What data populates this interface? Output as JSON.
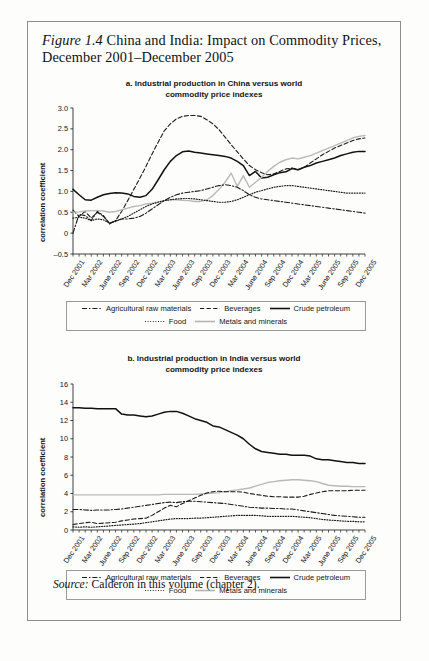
{
  "figure": {
    "label": "Figure 1.4",
    "title": "China and India: Impact on Commodity Prices, December 2001–December 2005",
    "source_label": "Source:",
    "source_text": "Calderón in this volume (chapter 2)."
  },
  "legend": {
    "items": [
      {
        "label": "Agricultural raw materials",
        "style": "dash-dot",
        "color": "#1a1a1a"
      },
      {
        "label": "Beverages",
        "style": "dashed",
        "color": "#1a1a1a"
      },
      {
        "label": "Crude petroleum",
        "style": "solid",
        "color": "#111111"
      },
      {
        "label": "Food",
        "style": "dotted",
        "color": "#1a1a1a"
      },
      {
        "label": "Metals and minerals",
        "style": "solid",
        "color": "#b4b4b4"
      }
    ],
    "row1": [
      "Agricultural raw materials",
      "Beverages",
      "Crude petroleum"
    ],
    "row2": [
      "Food",
      "Metals and minerals"
    ]
  },
  "chart_data": [
    {
      "type": "line",
      "panel": "a",
      "title": "a. Industrial production in China versus world commodity price indexes",
      "title_line1": "a. Industrial production in China versus world",
      "title_line2": "commodity price indexes",
      "xlabel": "",
      "ylabel": "correlation coefficient",
      "ylim": [
        -0.5,
        3.0
      ],
      "yticks": [
        3.0,
        2.5,
        2.0,
        1.5,
        1.0,
        0.5,
        0,
        -0.5
      ],
      "ytick_labels": [
        "3.0",
        "2.5",
        "2.0",
        "1.5",
        "1.0",
        "0.5",
        "0",
        "–0.5"
      ],
      "grid": false,
      "legend_position": "below",
      "x": [
        "Dec 2001",
        "Jan 2002",
        "Feb 2002",
        "Mar 2002",
        "Apr 2002",
        "May 2002",
        "June 2002",
        "July 2002",
        "Aug 2002",
        "Sep 2002",
        "Oct 2002",
        "Nov 2002",
        "Dec 2002",
        "Jan 2003",
        "Feb 2003",
        "Mar 2003",
        "Apr 2003",
        "May 2003",
        "June 2003",
        "July 2003",
        "Aug 2003",
        "Sep 2003",
        "Oct 2003",
        "Nov 2003",
        "Dec 2003",
        "Jan 2004",
        "Feb 2004",
        "Mar 2004",
        "Apr 2004",
        "May 2004",
        "June 2004",
        "July 2004",
        "Aug 2004",
        "Sep 2004",
        "Oct 2004",
        "Nov 2004",
        "Dec 2004",
        "Jan 2005",
        "Feb 2005",
        "Mar 2005",
        "Apr 2005",
        "May 2005",
        "June 2005",
        "July 2005",
        "Aug 2005",
        "Sep 2005",
        "Oct 2005",
        "Nov 2005",
        "Dec 2005"
      ],
      "xtick_labels": [
        "Dec 2001",
        "Mar 2002",
        "June 2002",
        "Sep 2002",
        "Dec 2002",
        "Mar 2003",
        "June 2003",
        "Sep 2003",
        "Dec 2003",
        "Mar 2004",
        "June 2004",
        "Sep 2004",
        "Dec 2004",
        "Mar 2005",
        "June 2005",
        "Sep 2005",
        "Dec 2005"
      ],
      "xtick_indices": [
        0,
        3,
        6,
        9,
        12,
        15,
        18,
        21,
        24,
        27,
        30,
        33,
        36,
        39,
        42,
        45,
        48
      ],
      "series": [
        {
          "name": "Crude petroleum",
          "style": "solid",
          "color": "#111111",
          "width": 1.5,
          "values": [
            1.05,
            0.92,
            0.8,
            0.79,
            0.86,
            0.92,
            0.95,
            0.97,
            0.96,
            0.94,
            0.88,
            0.86,
            0.9,
            1.05,
            1.28,
            1.52,
            1.72,
            1.86,
            1.95,
            1.97,
            1.94,
            1.92,
            1.9,
            1.88,
            1.86,
            1.84,
            1.8,
            1.72,
            1.62,
            1.38,
            1.48,
            1.32,
            1.34,
            1.4,
            1.45,
            1.47,
            1.55,
            1.52,
            1.58,
            1.62,
            1.68,
            1.72,
            1.76,
            1.8,
            1.86,
            1.9,
            1.94,
            1.96,
            1.96
          ]
        },
        {
          "name": "Beverages",
          "style": "dashed",
          "color": "#1a1a1a",
          "width": 1.1,
          "values": [
            0.55,
            0.4,
            0.52,
            0.36,
            0.5,
            0.4,
            0.24,
            0.3,
            0.52,
            0.78,
            1.05,
            1.32,
            1.6,
            1.9,
            2.18,
            2.45,
            2.62,
            2.74,
            2.8,
            2.82,
            2.82,
            2.8,
            2.72,
            2.62,
            2.48,
            2.3,
            2.12,
            1.95,
            1.78,
            1.62,
            1.52,
            1.45,
            1.4,
            1.42,
            1.48,
            1.54,
            1.56,
            1.52,
            1.58,
            1.68,
            1.78,
            1.88,
            1.96,
            2.04,
            2.1,
            2.16,
            2.22,
            2.26,
            2.28
          ]
        },
        {
          "name": "Metals and minerals",
          "style": "solid",
          "color": "#b9b9b9",
          "width": 1.4,
          "values": [
            0.5,
            0.51,
            0.53,
            0.54,
            0.54,
            0.53,
            0.5,
            0.52,
            0.56,
            0.6,
            0.64,
            0.66,
            0.7,
            0.72,
            0.75,
            0.78,
            0.8,
            0.8,
            0.79,
            0.78,
            0.76,
            0.76,
            0.8,
            0.9,
            1.05,
            1.22,
            1.44,
            1.12,
            1.38,
            1.1,
            1.22,
            1.34,
            1.48,
            1.6,
            1.7,
            1.76,
            1.8,
            1.78,
            1.82,
            1.86,
            1.92,
            1.98,
            2.04,
            2.1,
            2.16,
            2.22,
            2.28,
            2.32,
            2.34
          ]
        },
        {
          "name": "Agricultural raw materials",
          "style": "dash-dot",
          "color": "#1a1a1a",
          "width": 1.1,
          "values": [
            0.0,
            0.45,
            0.42,
            0.3,
            0.52,
            0.42,
            0.22,
            0.3,
            0.34,
            0.34,
            0.36,
            0.4,
            0.48,
            0.58,
            0.68,
            0.78,
            0.86,
            0.92,
            0.96,
            0.98,
            1.0,
            1.02,
            1.06,
            1.1,
            1.14,
            1.16,
            1.14,
            1.1,
            1.02,
            0.92,
            0.86,
            0.82,
            0.8,
            0.78,
            0.76,
            0.74,
            0.72,
            0.7,
            0.68,
            0.66,
            0.64,
            0.62,
            0.6,
            0.58,
            0.56,
            0.54,
            0.52,
            0.5,
            0.48
          ]
        },
        {
          "name": "Food",
          "style": "dotted",
          "color": "#1a1a1a",
          "width": 1.2,
          "values": [
            0.36,
            0.38,
            0.36,
            0.3,
            0.34,
            0.32,
            0.24,
            0.28,
            0.34,
            0.4,
            0.48,
            0.56,
            0.64,
            0.7,
            0.74,
            0.78,
            0.8,
            0.82,
            0.83,
            0.83,
            0.82,
            0.8,
            0.78,
            0.76,
            0.74,
            0.74,
            0.76,
            0.8,
            0.86,
            0.92,
            0.98,
            1.02,
            1.06,
            1.1,
            1.12,
            1.14,
            1.14,
            1.12,
            1.1,
            1.08,
            1.06,
            1.04,
            1.02,
            1.0,
            0.98,
            0.96,
            0.96,
            0.96,
            0.96
          ]
        }
      ]
    },
    {
      "type": "line",
      "panel": "b",
      "title": "b. Industrial production in India versus world commodity price indexes",
      "title_line1": "b. Industrial production in India versus world",
      "title_line2": "commodity price indexes",
      "xlabel": "",
      "ylabel": "correlation coefficient",
      "ylim": [
        0,
        16
      ],
      "yticks": [
        16,
        14,
        12,
        10,
        8,
        6,
        4,
        2,
        0
      ],
      "ytick_labels": [
        "16",
        "14",
        "12",
        "10",
        "8",
        "6",
        "4",
        "2",
        "0"
      ],
      "grid": false,
      "legend_position": "below",
      "x": [
        "Dec 2001",
        "Jan 2002",
        "Feb 2002",
        "Mar 2002",
        "Apr 2002",
        "May 2002",
        "June 2002",
        "July 2002",
        "Aug 2002",
        "Sep 2002",
        "Oct 2002",
        "Nov 2002",
        "Dec 2002",
        "Jan 2003",
        "Feb 2003",
        "Mar 2003",
        "Apr 2003",
        "May 2003",
        "June 2003",
        "July 2003",
        "Aug 2003",
        "Sep 2003",
        "Oct 2003",
        "Nov 2003",
        "Dec 2003",
        "Jan 2004",
        "Feb 2004",
        "Mar 2004",
        "Apr 2004",
        "May 2004",
        "June 2004",
        "July 2004",
        "Aug 2004",
        "Sep 2004",
        "Oct 2004",
        "Nov 2004",
        "Dec 2004",
        "Jan 2005",
        "Feb 2005",
        "Mar 2005",
        "Apr 2005",
        "May 2005",
        "June 2005",
        "July 2005",
        "Aug 2005",
        "Sep 2005",
        "Oct 2005",
        "Nov 2005",
        "Dec 2005"
      ],
      "xtick_labels": [
        "Dec 2001",
        "Mar 2002",
        "June 2002",
        "Sep 2002",
        "Dec 2002",
        "Mar 2003",
        "June 2003",
        "Sep 2003",
        "Dec 2003",
        "Mar 2004",
        "June 2004",
        "Sep 2004",
        "Dec 2004",
        "Mar 2005",
        "June 2005",
        "Sep 2005",
        "Dec 2005"
      ],
      "xtick_indices": [
        0,
        3,
        6,
        9,
        12,
        15,
        18,
        21,
        24,
        27,
        30,
        33,
        36,
        39,
        42,
        45,
        48
      ],
      "series": [
        {
          "name": "Crude petroleum",
          "style": "solid",
          "color": "#111111",
          "width": 1.5,
          "values": [
            13.4,
            13.4,
            13.35,
            13.35,
            13.3,
            13.3,
            13.3,
            13.3,
            12.7,
            12.6,
            12.6,
            12.5,
            12.4,
            12.5,
            12.7,
            12.9,
            13.0,
            13.0,
            12.8,
            12.5,
            12.2,
            12.0,
            11.8,
            11.4,
            11.3,
            11.0,
            10.7,
            10.4,
            10.0,
            9.4,
            8.9,
            8.6,
            8.5,
            8.4,
            8.3,
            8.3,
            8.2,
            8.2,
            8.2,
            8.1,
            7.8,
            7.7,
            7.7,
            7.6,
            7.5,
            7.4,
            7.4,
            7.3,
            7.3
          ]
        },
        {
          "name": "Metals and minerals",
          "style": "solid",
          "color": "#b9b9b9",
          "width": 1.4,
          "values": [
            3.85,
            3.85,
            3.85,
            3.85,
            3.85,
            3.85,
            3.85,
            3.85,
            3.85,
            3.85,
            3.85,
            3.85,
            3.85,
            3.85,
            3.85,
            3.9,
            3.9,
            3.9,
            3.9,
            3.9,
            3.9,
            3.95,
            4.0,
            4.05,
            4.1,
            4.2,
            4.3,
            4.4,
            4.5,
            4.6,
            4.8,
            5.0,
            5.2,
            5.3,
            5.4,
            5.45,
            5.5,
            5.5,
            5.45,
            5.4,
            5.3,
            5.1,
            4.9,
            4.85,
            4.8,
            4.8,
            4.75,
            4.75,
            4.75
          ]
        },
        {
          "name": "Beverages",
          "style": "dashed",
          "color": "#1a1a1a",
          "width": 1.1,
          "values": [
            0.6,
            0.7,
            0.8,
            0.85,
            0.7,
            0.75,
            0.8,
            0.85,
            1.0,
            1.1,
            1.2,
            1.25,
            1.3,
            1.6,
            2.0,
            2.4,
            2.7,
            2.55,
            2.9,
            3.2,
            3.5,
            3.8,
            4.05,
            4.2,
            4.25,
            4.2,
            4.2,
            4.2,
            4.15,
            4.0,
            3.9,
            3.8,
            3.7,
            3.65,
            3.65,
            3.6,
            3.6,
            3.6,
            3.7,
            3.9,
            4.05,
            4.2,
            4.3,
            4.3,
            4.3,
            4.3,
            4.35,
            4.35,
            4.35
          ]
        },
        {
          "name": "Agricultural raw materials",
          "style": "dash-dot",
          "color": "#1a1a1a",
          "width": 1.1,
          "values": [
            2.25,
            2.25,
            2.2,
            2.15,
            2.2,
            2.2,
            2.2,
            2.25,
            2.3,
            2.4,
            2.5,
            2.6,
            2.7,
            2.8,
            2.9,
            3.0,
            3.05,
            3.0,
            3.1,
            3.15,
            3.15,
            3.1,
            3.05,
            3.0,
            2.95,
            2.9,
            2.8,
            2.7,
            2.6,
            2.5,
            2.45,
            2.4,
            2.4,
            2.35,
            2.35,
            2.3,
            2.3,
            2.2,
            2.1,
            2.0,
            1.9,
            1.8,
            1.7,
            1.6,
            1.55,
            1.5,
            1.45,
            1.4,
            1.4
          ]
        },
        {
          "name": "Food",
          "style": "dotted",
          "color": "#1a1a1a",
          "width": 1.2,
          "values": [
            0.35,
            0.3,
            0.35,
            0.3,
            0.35,
            0.4,
            0.45,
            0.5,
            0.55,
            0.6,
            0.65,
            0.7,
            0.8,
            0.9,
            1.0,
            1.1,
            1.2,
            1.25,
            1.25,
            1.25,
            1.3,
            1.3,
            1.35,
            1.4,
            1.45,
            1.5,
            1.55,
            1.6,
            1.6,
            1.6,
            1.6,
            1.55,
            1.5,
            1.5,
            1.5,
            1.5,
            1.5,
            1.45,
            1.4,
            1.35,
            1.25,
            1.15,
            1.1,
            1.05,
            1.0,
            0.95,
            0.95,
            0.9,
            0.9
          ]
        }
      ]
    }
  ]
}
